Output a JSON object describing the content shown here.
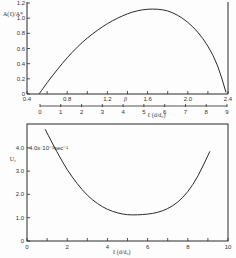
{
  "chart_data": [
    {
      "type": "line",
      "title": "",
      "ylabel": "A(ℓ)/A*",
      "xlabel": "β",
      "secondary_xlabel": "ℓ (d/d₀)",
      "xlim": [
        0.4,
        2.4
      ],
      "ylim": [
        0,
        1.2
      ],
      "x_ticks": [
        "0.4",
        "0.8",
        "1.2",
        "1.6",
        "2.0",
        "2.4"
      ],
      "y_ticks": [
        "0",
        "0.2",
        "0.4",
        "0.6",
        "0.8",
        "1.0",
        "1.2"
      ],
      "secondary_x_ticks": [
        "0",
        "1",
        "2",
        "3",
        "4",
        "5",
        "6",
        "7",
        "8",
        "9"
      ],
      "grid": false,
      "series": [
        {
          "name": "curve",
          "x": [
            0.52,
            0.6,
            0.7,
            0.8,
            0.9,
            1.0,
            1.1,
            1.2,
            1.3,
            1.4,
            1.5,
            1.6,
            1.7,
            1.8,
            1.9,
            2.0,
            2.1,
            2.2,
            2.3,
            2.38
          ],
          "y": [
            0.0,
            0.15,
            0.32,
            0.48,
            0.62,
            0.74,
            0.84,
            0.93,
            1.0,
            1.06,
            1.1,
            1.12,
            1.12,
            1.1,
            1.04,
            0.95,
            0.82,
            0.64,
            0.38,
            0.02
          ]
        }
      ]
    },
    {
      "type": "line",
      "title": "",
      "ylabel": "U₂",
      "y_unit_annotation": "4.0x·10⁻³sec⁻¹",
      "xlabel": "ℓ (d/d₀)",
      "xlim": [
        0,
        10
      ],
      "ylim": [
        0,
        5
      ],
      "x_ticks": [
        "0",
        "2",
        "4",
        "6",
        "8",
        "10"
      ],
      "y_ticks": [
        "0",
        "1.0",
        "2.0",
        "3.0",
        "4.0"
      ],
      "grid": false,
      "series": [
        {
          "name": "U2",
          "x": [
            0.9,
            1.5,
            2.0,
            2.5,
            3.0,
            3.5,
            4.0,
            4.5,
            5.0,
            5.5,
            6.0,
            6.5,
            7.0,
            7.5,
            8.0,
            8.5,
            9.1
          ],
          "y": [
            4.8,
            3.8,
            3.05,
            2.45,
            1.95,
            1.6,
            1.35,
            1.2,
            1.12,
            1.12,
            1.15,
            1.22,
            1.38,
            1.65,
            2.1,
            2.75,
            3.85
          ]
        }
      ]
    }
  ]
}
